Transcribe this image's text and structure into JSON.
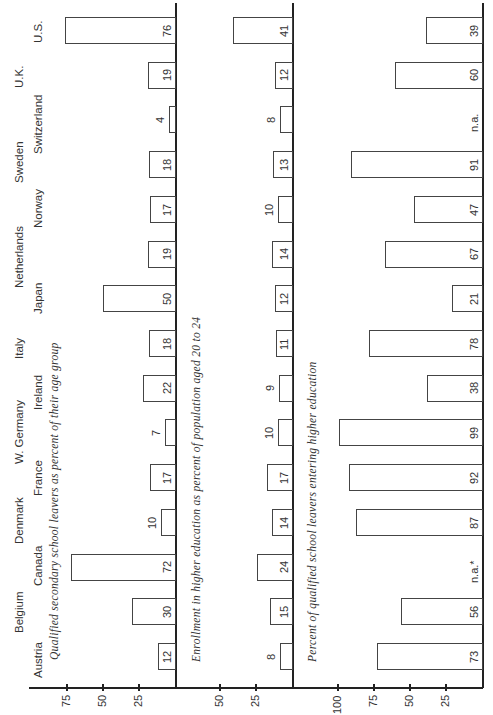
{
  "chart_data": {
    "type": "bar",
    "orientation": "rotated 90 degrees (page turned sideways)",
    "categories": [
      "Austria",
      "Belgium",
      "Canada",
      "Denmark",
      "France",
      "W. Germany",
      "Ireland",
      "Italy",
      "Japan",
      "Netherlands",
      "Norway",
      "Sweden",
      "Switzerland",
      "U.K.",
      "U.S."
    ],
    "panels": [
      {
        "title": "Qualified secondary school leavers as percent of their age group",
        "values": [
          12,
          30,
          72,
          10,
          17,
          7,
          22,
          18,
          50,
          19,
          17,
          18,
          4,
          19,
          76
        ],
        "labels": [
          "12",
          "30",
          "72",
          "10",
          "17",
          "7",
          "22",
          "18",
          "50",
          "19",
          "17",
          "18",
          "4",
          "19",
          "76"
        ],
        "ticks": [
          "75",
          "50",
          "25"
        ],
        "ylim": [
          0,
          85
        ]
      },
      {
        "title": "Enrollment in higher education as percent of population aged 20 to 24",
        "values": [
          8,
          15,
          24,
          14,
          17,
          10,
          9,
          11,
          12,
          14,
          10,
          13,
          8,
          12,
          41
        ],
        "labels": [
          "8",
          "15",
          "24",
          "14",
          "17",
          "10",
          "9",
          "11",
          "12",
          "14",
          "10",
          "13",
          "8",
          "12",
          "41"
        ],
        "ticks": [
          "50",
          "25"
        ],
        "ylim": [
          0,
          60
        ]
      },
      {
        "title": "Percent of qualified school leavers entering higher education",
        "values": [
          73,
          56,
          null,
          87,
          92,
          99,
          38,
          78,
          21,
          67,
          47,
          91,
          null,
          60,
          39
        ],
        "labels": [
          "73",
          "56",
          "n.a.*",
          "87",
          "92",
          "99",
          "38",
          "78",
          "21",
          "67",
          "47",
          "91",
          "n.a.",
          "60",
          "39"
        ],
        "ticks": [
          "100",
          "75",
          "50",
          "25"
        ],
        "ylim": [
          0,
          110
        ]
      }
    ],
    "grid": false,
    "legend": null
  }
}
